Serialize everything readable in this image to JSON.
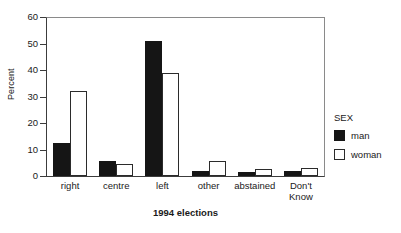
{
  "chart_data": {
    "type": "bar",
    "title": "",
    "xlabel": "1994 elections",
    "ylabel": "Percent",
    "ylim": [
      0,
      60
    ],
    "yticks": [
      0,
      10,
      20,
      30,
      40,
      50,
      60
    ],
    "ytick_labels": [
      "0",
      "10",
      "20",
      "30",
      "40",
      "50",
      "60"
    ],
    "grid": false,
    "legend_position": "right",
    "legend_title": "SEX",
    "categories": [
      "right",
      "centre",
      "left",
      "other",
      "abstained",
      "Don't Know"
    ],
    "series": [
      {
        "name": "man",
        "color": "#151515",
        "values": [
          12.5,
          5.5,
          51.0,
          2.0,
          1.7,
          1.8
        ]
      },
      {
        "name": "woman",
        "color": "#ffffff",
        "values": [
          32.0,
          4.5,
          39.0,
          5.8,
          2.8,
          3.0
        ]
      }
    ]
  }
}
